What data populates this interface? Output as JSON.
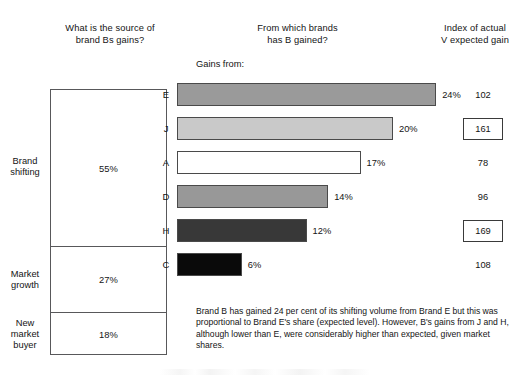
{
  "headings": {
    "left": "What is the source of\nbrand Bs gains?",
    "middle": "From which brands\nhas B gained?",
    "right": "Index of actual\nV expected gain"
  },
  "source_panel": {
    "segments": [
      {
        "label": "Brand\nshifting",
        "value": "55%",
        "pct": 55
      },
      {
        "label": "Market\ngrowth",
        "value": "27%",
        "pct": 27
      },
      {
        "label": "New\nmarket\nbuyer",
        "value": "18%",
        "pct": 18
      }
    ]
  },
  "bar_panel": {
    "gains_from_label": "Gains from:"
  },
  "caption": "Brand B has gained 24 per cent of its shifting volume from Brand E but this was proportional to Brand E's share (expected level). However, B's gains from J and H, although lower than E, were considerably higher than expected, given market shares.",
  "chart_data": {
    "type": "bar",
    "title": "From which brands has B gained?",
    "xlabel": "",
    "ylabel": "Gains from:",
    "orientation": "horizontal",
    "categories": [
      "E",
      "J",
      "A",
      "D",
      "H",
      "C"
    ],
    "values": [
      24,
      20,
      17,
      14,
      12,
      6
    ],
    "value_labels": [
      "24%",
      "20%",
      "17%",
      "14%",
      "12%",
      "6%"
    ],
    "xlim": [
      0,
      28
    ],
    "grid": false,
    "legend": false,
    "bar_colors": [
      "#9a9a9a",
      "#c9c9c9",
      "#ffffff",
      "#989898",
      "#383838",
      "#0a0a0a"
    ],
    "series": [
      {
        "name": "Index of actual V expected gain",
        "values": [
          102,
          161,
          78,
          96,
          169,
          108
        ],
        "labels": [
          "102",
          "161",
          "78",
          "96",
          "169",
          "108"
        ],
        "highlighted": [
          false,
          true,
          false,
          false,
          true,
          false
        ]
      }
    ]
  }
}
